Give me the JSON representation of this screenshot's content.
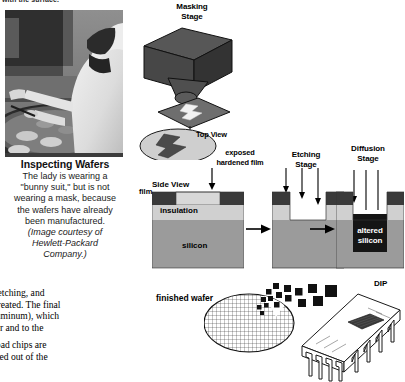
{
  "page": {
    "clipped_top_line": "with the surface."
  },
  "photo_panel": {
    "image_name": "photo-worker-inspecting-wafers",
    "caption_title": "Inspecting Wafers",
    "caption_lines": [
      "The lady is wearing a",
      "\"bunny suit,\" but is not",
      "wearing a mask, because",
      "the wafers have already",
      "been manufactured."
    ],
    "credit_lines": [
      "(Image courtesy of",
      "Hewlett-Packard",
      "Company.)"
    ]
  },
  "body_text": {
    "paragraph_1": [
      "sking, etching, and",
      "p are created. The final",
      "ally aluminum), which",
      "ch other and to the"
    ],
    "paragraph_2": [
      "r, and bad chips are",
      "are sliced out of the"
    ]
  },
  "diagram": {
    "masking_stage": {
      "label_line1": "Masking",
      "label_line2": "Stage",
      "top_view_label": "Top View"
    },
    "side_view": {
      "label": "Side View",
      "film_label": "film",
      "insulation_label": "insulation",
      "silicon_label": "silicon",
      "exposed_label_line1": "exposed",
      "exposed_label_line2": "hardened film"
    },
    "etching_stage": {
      "label_line1": "Etching",
      "label_line2": "Stage"
    },
    "diffusion_stage": {
      "label_line1": "Diffusion",
      "label_line2": "Stage",
      "altered_label_line1": "altered",
      "altered_label_line2": "silicon"
    },
    "finished_wafer": {
      "label": "finished wafer"
    },
    "package": {
      "label": "DIP"
    }
  },
  "colors": {
    "film_dark": "#3a3a3a",
    "insulation_light": "#d0d0d0",
    "silicon_gray": "#9b9b9b",
    "altered_silicon": "#151515",
    "mask_box": "#4a4a4a",
    "mask_box_side": "#3b3b3b",
    "mask_plate": "#6e6e6e",
    "top_view_fill": "#cfcfcf",
    "line": "#000000",
    "background": "#ffffff"
  }
}
